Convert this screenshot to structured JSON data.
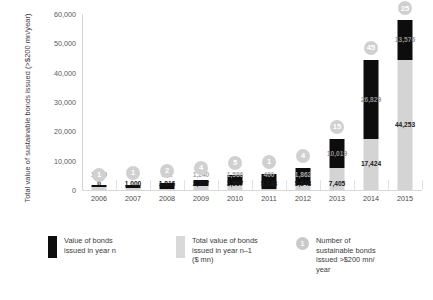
{
  "chart_data": {
    "type": "bar",
    "subtype": "stacked-bar",
    "title": "",
    "xlabel": "",
    "ylabel": "Total value of sustainable bonds issued (>$200 mn/year)",
    "ylim": [
      0,
      60000
    ],
    "ytick_labels": [
      "60,000",
      "50,000",
      "40,000",
      "30,000",
      "20,000",
      "10,000",
      "0"
    ],
    "ytick_values": [
      60000,
      50000,
      40000,
      30000,
      20000,
      10000,
      0
    ],
    "grid": false,
    "legend_position": "bottom",
    "categories": [
      "2006",
      "2007",
      "2008",
      "2009",
      "2010",
      "2011",
      "2012",
      "2013",
      "2014",
      "2015"
    ],
    "series": [
      {
        "name": "Total value of bonds issued in year n-1 ($ mn)",
        "key": "gray",
        "color": "#d4d4d4",
        "values": [
          1000,
          816,
          501,
          1240,
          1586,
          400,
          1862,
          7405,
          17424,
          44253
        ],
        "labels": [
          "1,000",
          "816",
          "501",
          "1,240",
          "1,586",
          "400",
          "1,862",
          "7,405",
          "17,424",
          "44,253"
        ]
      },
      {
        "name": "Value of bonds issued in year n",
        "key": "black",
        "color": "#0d0d0d",
        "values": [
          0,
          1000,
          1816,
          2317,
          3557,
          5143,
          5543,
          10019,
          26829,
          13576
        ],
        "labels": [
          "0",
          "1,000",
          "1,816",
          "2,317",
          "3,557",
          "5,143",
          "5,543",
          "10,019",
          "26,829",
          "13,576"
        ]
      }
    ],
    "annotations": {
      "name": "Number of sustainable bonds issued >$200 mn/year",
      "values": [
        1,
        1,
        2,
        4,
        5,
        1,
        4,
        15,
        45,
        25
      ],
      "labels": [
        "1",
        "1",
        "2",
        "4",
        "5",
        "1",
        "4",
        "15",
        "45",
        "25"
      ]
    }
  },
  "legend": {
    "items": [
      {
        "swatch": "black",
        "text": "Value of bonds\nissued in year n"
      },
      {
        "swatch": "gray",
        "text": "Total value of bonds\nissued in year n–1\n($ mn)"
      },
      {
        "swatch": "circle",
        "badge": "1",
        "text": "Number of\nsustainable bonds\nissued >$200 mn/\nyear"
      }
    ]
  },
  "colors": {
    "black": "#0d0d0d",
    "gray": "#d4d4d4",
    "badge": "#d0d0d0",
    "axis": "#d3d3d3",
    "text": "#3a3a3a"
  }
}
